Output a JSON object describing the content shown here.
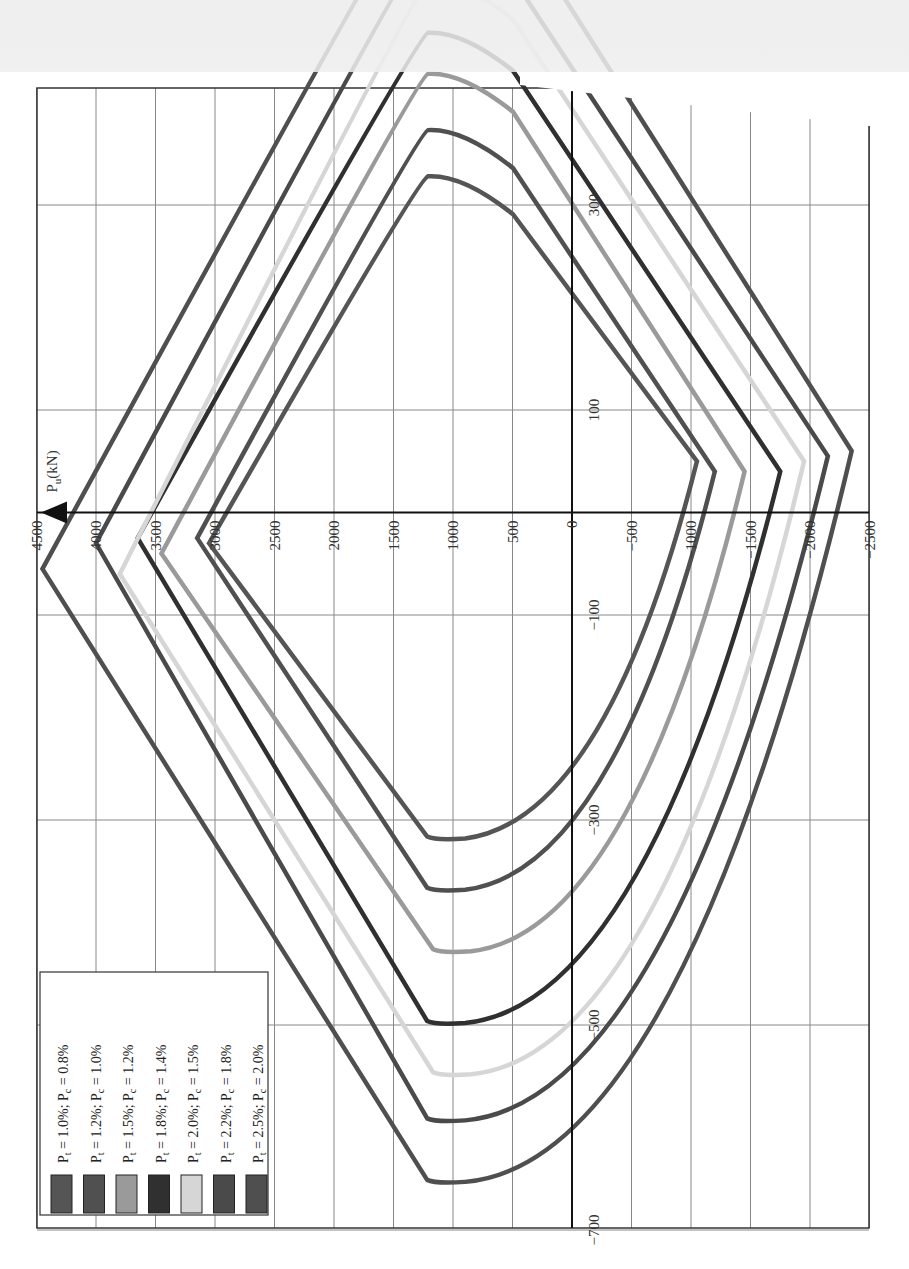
{
  "chart_data": {
    "type": "line",
    "title": "",
    "orientation": "rotated 90° counter-clockwise",
    "xlabel": "M (moment)",
    "ylabel": "P_u(kN)",
    "pu_ticks": [
      "4500",
      "4000",
      "3500",
      "3000",
      "2500",
      "2000",
      "1500",
      "1000",
      "500",
      "0",
      "−500",
      "−1000",
      "−1500",
      "−2000",
      "−2500"
    ],
    "m_ticks": [
      "300",
      "100",
      "−100",
      "−300",
      "−500",
      "−700"
    ],
    "pu_range": [
      -2500,
      4500
    ],
    "m_range": [
      -700,
      400
    ],
    "grid": true,
    "legend_position": "bottom-left (rotated)",
    "series": [
      {
        "name": "Pt = 1.0%; Pc = 0.8%",
        "color": "#555555",
        "points": [
          [
            3050,
            -30
          ],
          [
            1150,
            -320
          ],
          [
            -1050,
            50
          ],
          [
            1000,
            330
          ],
          [
            3050,
            -30
          ]
        ]
      },
      {
        "name": "Pt = 1.2%; Pc = 1.0%",
        "color": "#505050",
        "points": [
          [
            3150,
            -25
          ],
          [
            1150,
            -370
          ],
          [
            -1200,
            40
          ],
          [
            1000,
            375
          ],
          [
            3150,
            -25
          ]
        ]
      },
      {
        "name": "Pt = 1.5%; Pc = 1.2%",
        "color": "#9a9a9a",
        "points": [
          [
            3450,
            -40
          ],
          [
            1100,
            -430
          ],
          [
            -1450,
            40
          ],
          [
            1000,
            430
          ],
          [
            3450,
            -40
          ]
        ]
      },
      {
        "name": "Pt = 1.8%; Pc = 1.4%",
        "color": "#303030",
        "points": [
          [
            3650,
            -25
          ],
          [
            1150,
            -500
          ],
          [
            -1750,
            40
          ],
          [
            1000,
            470
          ],
          [
            3650,
            -25
          ]
        ]
      },
      {
        "name": "Pt = 2.0%; Pc = 1.5%",
        "color": "#d6d6d6",
        "points": [
          [
            3800,
            -60
          ],
          [
            1100,
            -550
          ],
          [
            -1950,
            50
          ],
          [
            1000,
            520
          ],
          [
            3800,
            -60
          ]
        ]
      },
      {
        "name": "Pt = 2.2%; Pc = 1.8%",
        "color": "#4a4a4a",
        "points": [
          [
            4000,
            -30
          ],
          [
            1150,
            -595
          ],
          [
            -2150,
            55
          ],
          [
            1000,
            560
          ],
          [
            4000,
            -30
          ]
        ]
      },
      {
        "name": "Pt = 2.5%; Pc = 2.0%",
        "color": "#4f4f4f",
        "points": [
          [
            4450,
            -55
          ],
          [
            1150,
            -655
          ],
          [
            -2350,
            60
          ],
          [
            1000,
            620
          ],
          [
            4450,
            -55
          ]
        ]
      }
    ]
  },
  "axis": {
    "pu_label": "P",
    "pu_sub": "u",
    "pu_unit": "(kN)"
  },
  "legend": {
    "items": [
      {
        "pt": "1.0%",
        "pc": "0.8%",
        "color": "#555555"
      },
      {
        "pt": "1.2%",
        "pc": "1.0%",
        "color": "#505050"
      },
      {
        "pt": "1.5%",
        "pc": "1.2%",
        "color": "#9a9a9a"
      },
      {
        "pt": "1.8%",
        "pc": "1.4%",
        "color": "#303030"
      },
      {
        "pt": "2.0%",
        "pc": "1.5%",
        "color": "#d6d6d6"
      },
      {
        "pt": "2.2%",
        "pc": "1.8%",
        "color": "#4a4a4a"
      },
      {
        "pt": "2.5%",
        "pc": "2.0%",
        "color": "#4f4f4f"
      }
    ]
  }
}
